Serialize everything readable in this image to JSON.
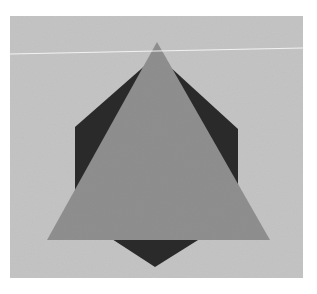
{
  "image": {
    "description": "Grayscale photograph of a mid-gray triangle overlapping a dark hexagon on a light gray background",
    "colors": {
      "page_background": "#ffffff",
      "panel_background": "#c4c4c4",
      "triangle_fill": "#8f8f8f",
      "hexagon_fill": "#2a2a2a",
      "streak_line": "#f2f2f2"
    },
    "shapes": {
      "panel": {
        "x": 10,
        "y": 16,
        "width": 293,
        "height": 262
      },
      "streak_line": {
        "x1": 10,
        "y1": 54,
        "x2": 303,
        "y2": 48
      },
      "hexagon_points": "157,55 238,129 238,215 155,267 75,215 75,127",
      "triangle_points": "157,42 270,240 47,240"
    }
  }
}
